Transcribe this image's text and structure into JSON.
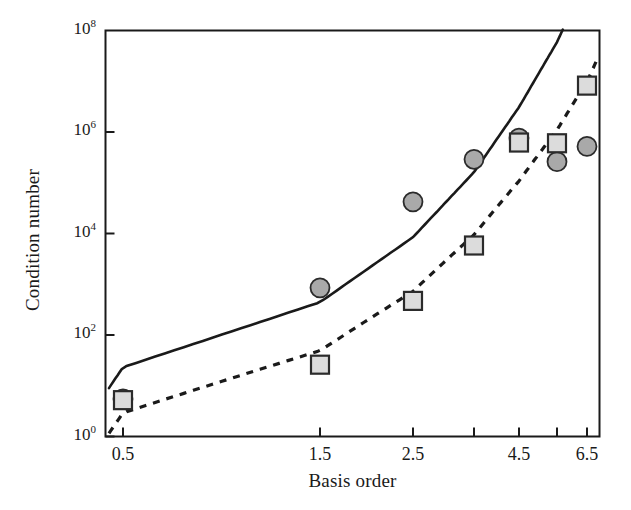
{
  "chart_data": {
    "type": "scatter",
    "title": "",
    "xlabel": "Basis order",
    "ylabel": "Condition number",
    "yscale": "log",
    "ylim": [
      1,
      100000000
    ],
    "grid": false,
    "legend": "none",
    "ytick_labels": [
      "10",
      "10",
      "10",
      "10",
      "10"
    ],
    "ytick_exponents": [
      "8",
      "6",
      "4",
      "2",
      "0"
    ],
    "ytick_values": [
      100000000,
      1000000,
      10000,
      100,
      1
    ],
    "xtick_labels": [
      "0.5",
      "1.5",
      "2.5",
      "4.5",
      "6.5"
    ],
    "xtick_values": [
      0.5,
      1.5,
      2.5,
      4.5,
      6.5
    ],
    "xlim": [
      0.1,
      7.1
    ],
    "series": [
      {
        "name": "circles",
        "marker": "circle",
        "marker_fill": "#a9a9a9",
        "marker_edge": "#2b2b2b",
        "line_style": "solid",
        "line_color": "#1a1a1a",
        "points": [
          {
            "x": 0.5,
            "y": 5.5
          },
          {
            "x": 1.5,
            "y": 850
          },
          {
            "x": 2.5,
            "y": 42000
          },
          {
            "x": 3.5,
            "y": 290000
          },
          {
            "x": 4.5,
            "y": 760000
          },
          {
            "x": 5.5,
            "y": 260000
          },
          {
            "x": 6.5,
            "y": 520000
          }
        ]
      },
      {
        "name": "squares",
        "marker": "square",
        "marker_fill": "#dcdcdc",
        "marker_edge": "#2b2b2b",
        "line_style": "dashed",
        "line_color": "#1a1a1a",
        "points": [
          {
            "x": 0.5,
            "y": 5.2
          },
          {
            "x": 1.5,
            "y": 26
          },
          {
            "x": 2.5,
            "y": 470
          },
          {
            "x": 3.5,
            "y": 5800
          },
          {
            "x": 4.5,
            "y": 620000
          },
          {
            "x": 5.5,
            "y": 600000
          },
          {
            "x": 6.5,
            "y": 8200000
          }
        ]
      }
    ]
  },
  "axes": {
    "y_title": "Condition number",
    "x_title": "Basis order"
  }
}
